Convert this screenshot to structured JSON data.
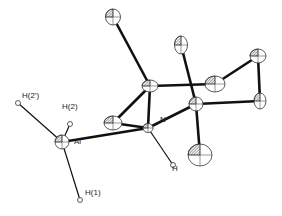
{
  "figure": {
    "type": "ORTEP molecular structure",
    "colors": {
      "bond": "#111111",
      "ellipsoid_stroke": "#333333",
      "hatch": "#555555",
      "background": "#ffffff"
    }
  },
  "atoms": [
    {
      "id": "Al",
      "label": "Al",
      "x": 62,
      "y": 142,
      "rx": 7,
      "ry": 7,
      "kind": "ellipsoid"
    },
    {
      "id": "H2p",
      "label": "H(2')",
      "x": 18,
      "y": 103,
      "r": 2.5,
      "kind": "hydrogen"
    },
    {
      "id": "H2",
      "label": "H(2)",
      "x": 70,
      "y": 124,
      "r": 2.5,
      "kind": "hydrogen"
    },
    {
      "id": "H1",
      "label": "H(1)",
      "x": 80,
      "y": 200,
      "r": 2.5,
      "kind": "hydrogen"
    },
    {
      "id": "N",
      "label": "N",
      "x": 148,
      "y": 128,
      "rx": 5,
      "ry": 4.5,
      "kind": "ellipsoid"
    },
    {
      "id": "HN",
      "label": "H",
      "x": 173,
      "y": 165,
      "r": 2.5,
      "kind": "hydrogen"
    },
    {
      "id": "C1",
      "label": "",
      "x": 113,
      "y": 123,
      "rx": 9,
      "ry": 7,
      "kind": "ellipsoid"
    },
    {
      "id": "C2",
      "label": "",
      "x": 150,
      "y": 86,
      "rx": 8,
      "ry": 6,
      "kind": "ellipsoid"
    },
    {
      "id": "C3",
      "label": "",
      "x": 113,
      "y": 17,
      "rx": 7.5,
      "ry": 8,
      "kind": "ellipsoid"
    },
    {
      "id": "C4",
      "label": "",
      "x": 181,
      "y": 45,
      "rx": 6.5,
      "ry": 9,
      "kind": "ellipsoid"
    },
    {
      "id": "C5",
      "label": "",
      "x": 196,
      "y": 104,
      "rx": 7,
      "ry": 7,
      "kind": "ellipsoid"
    },
    {
      "id": "C6",
      "label": "",
      "x": 215,
      "y": 84,
      "rx": 10,
      "ry": 8,
      "kind": "ellipsoid"
    },
    {
      "id": "C7",
      "label": "",
      "x": 258,
      "y": 56,
      "rx": 8,
      "ry": 7,
      "kind": "ellipsoid"
    },
    {
      "id": "C8",
      "label": "",
      "x": 260,
      "y": 101,
      "rx": 6,
      "ry": 8,
      "kind": "ellipsoid"
    },
    {
      "id": "C9",
      "label": "",
      "x": 200,
      "y": 155,
      "rx": 12,
      "ry": 11,
      "kind": "ellipsoid"
    }
  ],
  "bonds": [
    [
      "Al",
      "H2p"
    ],
    [
      "Al",
      "H2"
    ],
    [
      "Al",
      "H1"
    ],
    [
      "Al",
      "N"
    ],
    [
      "N",
      "HN"
    ],
    [
      "N",
      "C1"
    ],
    [
      "N",
      "C2"
    ],
    [
      "N",
      "C5"
    ],
    [
      "C1",
      "C2"
    ],
    [
      "C2",
      "C3"
    ],
    [
      "C2",
      "C6"
    ],
    [
      "C5",
      "C4"
    ],
    [
      "C5",
      "C8"
    ],
    [
      "C5",
      "C9"
    ],
    [
      "C6",
      "C7"
    ],
    [
      "C7",
      "C8"
    ]
  ],
  "labels": [
    {
      "text": "H(2')",
      "x": 22,
      "y": 99
    },
    {
      "text": "H(2)",
      "x": 62,
      "y": 110
    },
    {
      "text": "Al",
      "x": 74,
      "y": 145
    },
    {
      "text": "N",
      "x": 160,
      "y": 123
    },
    {
      "text": "H",
      "x": 172,
      "y": 172
    },
    {
      "text": "H(1)",
      "x": 85,
      "y": 196
    }
  ]
}
